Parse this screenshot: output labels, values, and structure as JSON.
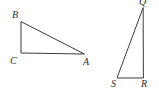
{
  "figure": {
    "kind": "geometry-diagram",
    "background_color": "#ffffff",
    "stroke_color": "#3b3b3b",
    "label_color": "#2e2e2e",
    "canvas": {
      "width": 159,
      "height": 93
    }
  },
  "shapes": [
    {
      "name": "triangle-abc",
      "label": "Triangle ABC",
      "right_angle_at": "C",
      "vertices": [
        {
          "id": "B",
          "label": "B",
          "x": 21,
          "y": 22
        },
        {
          "id": "C",
          "label": "C",
          "x": 21,
          "y": 53
        },
        {
          "id": "A",
          "label": "A",
          "x": 84,
          "y": 54
        }
      ],
      "path": "M 21 22 L 21 53 L 84 54 Z",
      "edges": [
        {
          "name": "BC",
          "from": "B",
          "to": "C"
        },
        {
          "name": "CA",
          "from": "C",
          "to": "A"
        },
        {
          "name": "AB",
          "from": "A",
          "to": "B"
        }
      ]
    },
    {
      "name": "triangle-qrs",
      "label": "Triangle QRS",
      "right_angle_at": "R",
      "vertices": [
        {
          "id": "Q",
          "label": "Q",
          "x": 143,
          "y": 8
        },
        {
          "id": "S",
          "label": "S",
          "x": 117,
          "y": 78
        },
        {
          "id": "R",
          "label": "R",
          "x": 143,
          "y": 78
        }
      ],
      "path": "M 143 8 L 117 78 L 143 78 Z",
      "edges": [
        {
          "name": "QS",
          "from": "Q",
          "to": "S"
        },
        {
          "name": "SR",
          "from": "S",
          "to": "R"
        },
        {
          "name": "RQ",
          "from": "R",
          "to": "Q"
        }
      ]
    }
  ],
  "labels": {
    "B": "B",
    "C": "C",
    "A": "A",
    "Q": "Q",
    "S": "S",
    "R": "R"
  }
}
